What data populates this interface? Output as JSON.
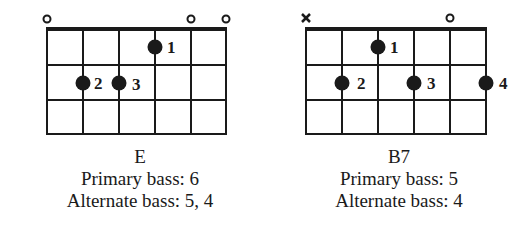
{
  "chords": [
    {
      "name": "E",
      "primary_bass": "Primary bass: 6",
      "alternate_bass": "Alternate bass: 5, 4",
      "string_markers": [
        {
          "string": 6,
          "type": "open"
        },
        {
          "string": 2,
          "type": "open"
        },
        {
          "string": 1,
          "type": "open"
        }
      ],
      "fingers": [
        {
          "finger": "1",
          "string": 3,
          "fret": 1
        },
        {
          "finger": "2",
          "string": 5,
          "fret": 2
        },
        {
          "finger": "3",
          "string": 4,
          "fret": 2
        }
      ]
    },
    {
      "name": "B7",
      "primary_bass": "Primary bass: 5",
      "alternate_bass": "Alternate bass: 4",
      "string_markers": [
        {
          "string": 6,
          "type": "muted"
        },
        {
          "string": 2,
          "type": "open"
        }
      ],
      "fingers": [
        {
          "finger": "1",
          "string": 4,
          "fret": 1
        },
        {
          "finger": "2",
          "string": 5,
          "fret": 2
        },
        {
          "finger": "3",
          "string": 3,
          "fret": 2
        },
        {
          "finger": "4",
          "string": 1,
          "fret": 2
        }
      ]
    }
  ]
}
